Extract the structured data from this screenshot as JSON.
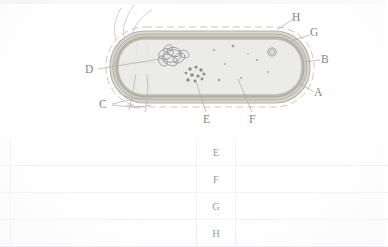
{
  "figure": {
    "kind": "prokaryotic-cell-cross-section-diagram",
    "caption": "",
    "labels": [
      {
        "id": "A",
        "text": "A",
        "points_to": "capsule / slime layer (outermost dashed boundary)",
        "x": 318,
        "y": 92
      },
      {
        "id": "B",
        "text": "B",
        "points_to": "cell wall (outer layer of envelope)",
        "x": 324,
        "y": 59
      },
      {
        "id": "C",
        "text": "C",
        "points_to": "pili / fimbriae (hair-like surface appendages)",
        "x": 101,
        "y": 99
      },
      {
        "id": "D",
        "text": "D",
        "points_to": "nucleoid / circular chromosomal DNA",
        "x": 87,
        "y": 64
      },
      {
        "id": "E",
        "text": "E",
        "points_to": "ribosomes (cluster of dark granules)",
        "x": 204,
        "y": 115
      },
      {
        "id": "F",
        "text": "F",
        "points_to": "cytoplasm",
        "x": 250,
        "y": 115
      },
      {
        "id": "G",
        "text": "G",
        "points_to": "plasma membrane",
        "x": 313,
        "y": 31
      },
      {
        "id": "H",
        "text": "H",
        "points_to": "flagellum / outer envelope boundary",
        "x": 295,
        "y": 14
      }
    ],
    "structures": {
      "flagella": "wavy filaments extending from upper-left of cell",
      "nucleoid": "tangled loops of DNA at left-centre of cytoplasm",
      "ribosomes": "scattered dark dots, densest below the nucleoid",
      "plasmid": "small double circle near upper right inside cell",
      "envelope_layers": 3
    },
    "colors": {
      "cytoplasm": "#ebebe9",
      "envelope_outer": "#b9b6ac",
      "envelope_mid": "#d6d3c9",
      "envelope_inner": "#cfccc2",
      "capsule_dash": "#c9c7c0",
      "ink": "#84848a",
      "granule": "#8c8c90"
    }
  },
  "answer_table": {
    "column_headers": [
      "",
      "",
      "",
      ""
    ],
    "rows": [
      {
        "lead": "",
        "answer_blank": "",
        "key": "E",
        "notes_blank": ""
      },
      {
        "lead": "",
        "answer_blank": "",
        "key": "F",
        "notes_blank": ""
      },
      {
        "lead": "",
        "answer_blank": "",
        "key": "G",
        "notes_blank": ""
      },
      {
        "lead": "",
        "answer_blank": "",
        "key": "H",
        "notes_blank": ""
      }
    ]
  }
}
